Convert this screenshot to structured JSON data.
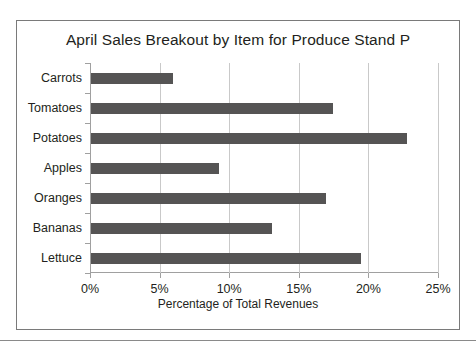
{
  "chart_data": {
    "type": "bar",
    "orientation": "horizontal",
    "title": "April Sales Breakout by Item for Produce Stand P",
    "xlabel": "Percentage of Total Revenues",
    "ylabel": "",
    "categories": [
      "Carrots",
      "Tomatoes",
      "Potatoes",
      "Apples",
      "Oranges",
      "Bananas",
      "Lettuce"
    ],
    "values": [
      5.9,
      17.4,
      22.7,
      9.2,
      16.9,
      13.0,
      19.4
    ],
    "xlim": [
      0,
      25
    ],
    "xticks": [
      0,
      5,
      10,
      15,
      20,
      25
    ],
    "xticklabels": [
      "0%",
      "5%",
      "10%",
      "15%",
      "20%",
      "25%"
    ],
    "grid": "vertical",
    "legend": "none",
    "bar_color": "#555454",
    "gridline_color": "#c9c9c9",
    "axis_color": "#a0a0a0",
    "text_color": "#231f20",
    "frame_color": "#7a7a7a"
  }
}
